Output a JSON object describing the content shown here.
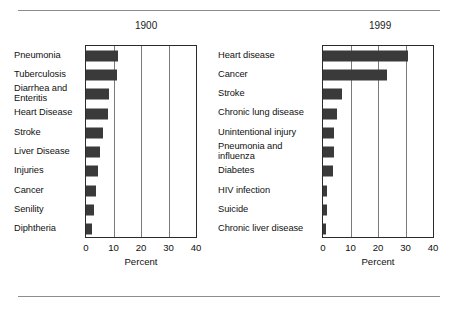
{
  "figure": {
    "divider_top": "horizontal-rule",
    "divider_bottom": "horizontal-rule"
  },
  "chart_data": [
    {
      "type": "bar",
      "orientation": "horizontal",
      "title": "1900",
      "xlabel": "Percent",
      "ylabel": "",
      "xlim": [
        0,
        40
      ],
      "xticks": [
        0,
        10,
        20,
        30,
        40
      ],
      "xticklabels": [
        "0",
        "10",
        "20",
        "30",
        "40"
      ],
      "grid": true,
      "grid_axis": "x",
      "legend": "none",
      "bar_color": "#3a3a3a",
      "categories": [
        "Pneumonia",
        "Tuberculosis",
        "Diarrhea and Enteritis",
        "Heart Disease",
        "Stroke",
        "Liver Disease",
        "Injuries",
        "Cancer",
        "Senility",
        "Diphtheria"
      ],
      "category_lines": [
        [
          "Pneumonia"
        ],
        [
          "Tuberculosis"
        ],
        [
          "Diarrhea and",
          "Enteritis"
        ],
        [
          "Heart Disease"
        ],
        [
          "Stroke"
        ],
        [
          "Liver Disease"
        ],
        [
          "Injuries"
        ],
        [
          "Cancer"
        ],
        [
          "Senility"
        ],
        [
          "Diphtheria"
        ]
      ],
      "values": [
        11.8,
        11.3,
        8.3,
        8.0,
        6.2,
        5.2,
        4.2,
        3.7,
        2.9,
        2.3
      ]
    },
    {
      "type": "bar",
      "orientation": "horizontal",
      "title": "1999",
      "xlabel": "Percent",
      "ylabel": "",
      "xlim": [
        0,
        40
      ],
      "xticks": [
        0,
        10,
        20,
        30,
        40
      ],
      "xticklabels": [
        "0",
        "10",
        "20",
        "30",
        "40"
      ],
      "grid": true,
      "grid_axis": "x",
      "legend": "none",
      "bar_color": "#3a3a3a",
      "categories": [
        "Heart disease",
        "Cancer",
        "Stroke",
        "Chronic lung disease",
        "Unintentional injury",
        "Pneumonia and influenza",
        "Diabetes",
        "HIV infection",
        "Suicide",
        "Chronic liver disease"
      ],
      "category_lines": [
        [
          "Heart disease"
        ],
        [
          "Cancer"
        ],
        [
          "Stroke"
        ],
        [
          "Chronic lung disease"
        ],
        [
          "Unintentional injury"
        ],
        [
          "Pneumonia and",
          "influenza"
        ],
        [
          "Diabetes"
        ],
        [
          "HIV infection"
        ],
        [
          "Suicide"
        ],
        [
          "Chronic liver disease"
        ]
      ],
      "values": [
        31.0,
        23.3,
        7.0,
        5.2,
        4.1,
        3.9,
        3.8,
        1.4,
        1.3,
        1.1
      ]
    }
  ]
}
